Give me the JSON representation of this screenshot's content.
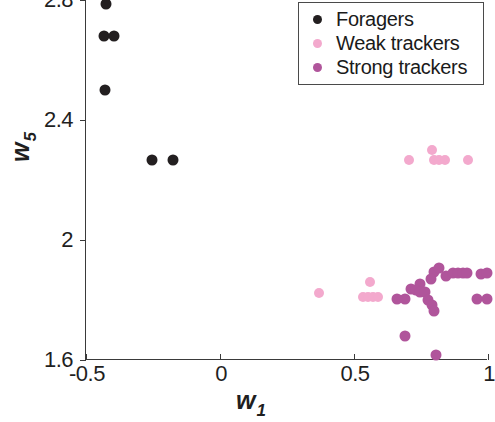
{
  "chart_data": {
    "type": "scatter",
    "title": "",
    "xlabel": "w_1",
    "ylabel": "w_5",
    "xlim": [
      -0.5,
      1.0
    ],
    "ylim": [
      1.6,
      2.8
    ],
    "xticks": [
      "-0.5",
      "0",
      "0.5",
      "1"
    ],
    "xtick_values": [
      -0.5,
      0,
      0.5,
      1
    ],
    "yticks": [
      "2.8",
      "2.4",
      "2",
      "1.6"
    ],
    "ytick_values": [
      2.8,
      2.4,
      2.0,
      1.6
    ],
    "grid": false,
    "legend_position": "top-right",
    "series": [
      {
        "name": "Foragers",
        "color": "#231f20",
        "marker": "circle",
        "marker_size": 11,
        "points": [
          [
            -0.425,
            2.787
          ],
          [
            -0.432,
            2.68
          ],
          [
            -0.395,
            2.68
          ],
          [
            -0.428,
            2.5
          ],
          [
            -0.255,
            2.267
          ],
          [
            -0.177,
            2.267
          ]
        ]
      },
      {
        "name": "Weak trackers",
        "color": "#f3a9cd",
        "marker": "circle",
        "marker_size": 10,
        "points": [
          [
            0.705,
            2.267
          ],
          [
            0.79,
            2.3
          ],
          [
            0.8,
            2.267
          ],
          [
            0.818,
            2.267
          ],
          [
            0.838,
            2.267
          ],
          [
            0.925,
            2.267
          ],
          [
            0.371,
            1.823
          ],
          [
            0.56,
            1.86
          ],
          [
            0.533,
            1.81
          ],
          [
            0.552,
            1.81
          ],
          [
            0.571,
            1.81
          ],
          [
            0.59,
            1.81
          ]
        ]
      },
      {
        "name": "Strong trackers",
        "color": "#b0559b",
        "marker": "circle",
        "marker_size": 11,
        "points": [
          [
            0.8,
            1.893
          ],
          [
            0.818,
            1.907
          ],
          [
            0.845,
            1.88
          ],
          [
            0.87,
            1.89
          ],
          [
            0.888,
            1.89
          ],
          [
            0.905,
            1.89
          ],
          [
            0.92,
            1.89
          ],
          [
            0.975,
            1.887
          ],
          [
            0.995,
            1.89
          ],
          [
            0.786,
            1.87
          ],
          [
            0.745,
            1.855
          ],
          [
            0.712,
            1.838
          ],
          [
            0.73,
            1.832
          ],
          [
            0.748,
            1.828
          ],
          [
            0.766,
            1.828
          ],
          [
            0.69,
            1.805
          ],
          [
            0.66,
            1.805
          ],
          [
            0.775,
            1.8
          ],
          [
            0.79,
            1.785
          ],
          [
            0.8,
            1.762
          ],
          [
            0.96,
            1.805
          ],
          [
            0.995,
            1.805
          ],
          [
            0.69,
            1.68
          ],
          [
            0.805,
            1.617
          ]
        ]
      }
    ]
  },
  "legend": {
    "items": [
      {
        "label": "Foragers",
        "color": "#231f20"
      },
      {
        "label": "Weak trackers",
        "color": "#f3a9cd"
      },
      {
        "label": "Strong trackers",
        "color": "#b0559b"
      }
    ]
  },
  "axes": {
    "ylabel_base": "w",
    "ylabel_sub": "5",
    "xlabel_base": "w",
    "xlabel_sub": "1"
  }
}
